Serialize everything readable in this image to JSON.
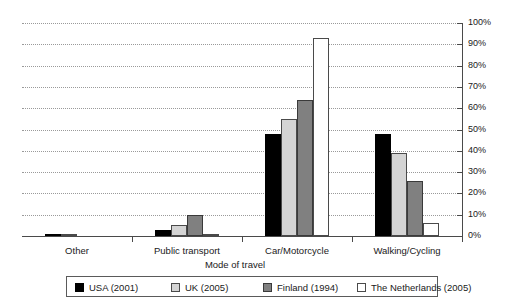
{
  "chart_data": {
    "type": "bar",
    "title": "",
    "xlabel": "Mode of travel",
    "ylabel": "",
    "ylim": [
      0,
      100
    ],
    "grid": true,
    "legend_position": "bottom",
    "categories": [
      "Other",
      "Public transport",
      "Car/Motorcycle",
      "Walking/Cycling"
    ],
    "ytick_labels": [
      "0%",
      "10%",
      "20%",
      "30%",
      "40%",
      "50%",
      "60%",
      "70%",
      "80%",
      "90%",
      "100%"
    ],
    "ytick_values": [
      0,
      10,
      20,
      30,
      40,
      50,
      60,
      70,
      80,
      90,
      100
    ],
    "series": [
      {
        "name": "USA (2001)",
        "color": "#000000",
        "values": [
          1,
          3,
          48,
          48
        ]
      },
      {
        "name": "UK (2005)",
        "color": "#d4d4d4",
        "values": [
          1,
          5,
          55,
          39
        ]
      },
      {
        "name": "Finland (1994)",
        "color": "#808080",
        "values": [
          0,
          10,
          64,
          26
        ]
      },
      {
        "name": "The Netherlands (2005)",
        "color": "#ffffff",
        "values": [
          0,
          1,
          93,
          6
        ]
      }
    ]
  },
  "axis": {
    "x_title": "Mode of travel"
  },
  "legend": {
    "entries": [
      {
        "label": "USA (2001)"
      },
      {
        "label": "UK (2005)"
      },
      {
        "label": "Finland (1994)"
      },
      {
        "label": "The Netherlands (2005)"
      }
    ]
  }
}
